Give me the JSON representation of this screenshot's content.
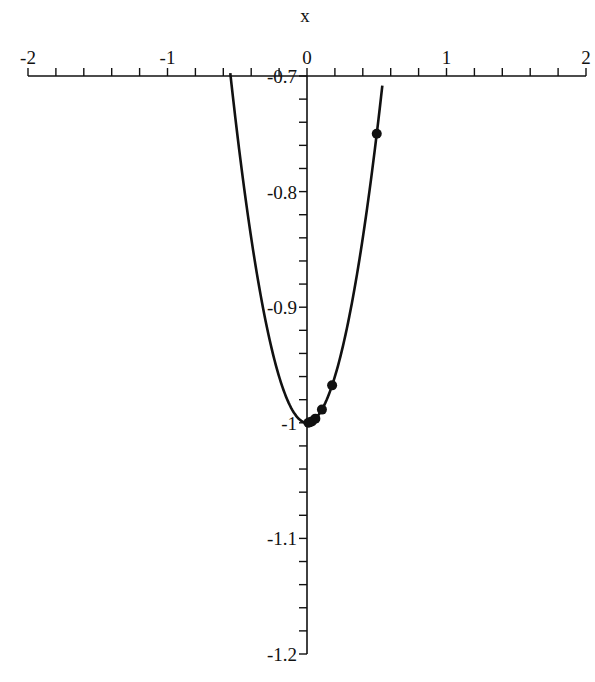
{
  "chart_data": {
    "type": "line",
    "title": "",
    "xlabel": "x",
    "ylabel": "",
    "xlim": [
      -2,
      2
    ],
    "ylim": [
      -1.2,
      -0.7
    ],
    "x_ticks": [
      -2,
      -1,
      0,
      1,
      2
    ],
    "x_tick_labels": [
      "-2",
      "-1",
      "0",
      "1",
      "2"
    ],
    "x_minor_step": 0.2,
    "y_ticks": [
      -0.7,
      -0.8,
      -0.9,
      -1,
      -1.1,
      -1.2
    ],
    "y_tick_labels": [
      "-0.7",
      "-0.8",
      "-0.9",
      "-1",
      "-1.1",
      "-1.2"
    ],
    "y_minor_step": 0.02,
    "grid": false,
    "series": [
      {
        "name": "curve",
        "expression": "x^2 - 1",
        "x_range": [
          -0.55,
          0.54
        ],
        "x": [
          -0.55,
          -0.5,
          -0.4,
          -0.3,
          -0.2,
          -0.1,
          0,
          0.1,
          0.2,
          0.3,
          0.4,
          0.5,
          0.54
        ],
        "values": [
          -0.6975,
          -0.75,
          -0.84,
          -0.91,
          -0.96,
          -0.99,
          -1,
          -0.99,
          -0.96,
          -0.91,
          -0.84,
          -0.75,
          -0.7084
        ],
        "style": "line",
        "color": "#111111"
      },
      {
        "name": "iterates",
        "style": "points",
        "x": [
          0.5,
          0.18,
          0.107,
          0.06,
          0.035,
          0.02,
          0.01
        ],
        "values": [
          -0.75,
          -0.9676,
          -0.9886,
          -0.9964,
          -0.9988,
          -0.9996,
          -0.9999
        ],
        "color": "#111111"
      }
    ]
  }
}
